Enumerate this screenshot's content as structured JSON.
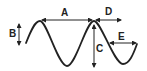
{
  "diagram": {
    "type": "wave-anatomy",
    "stroke_color": "#222222",
    "background": "#ffffff",
    "labels": {
      "A": "A",
      "B": "B",
      "C": "C",
      "D": "D",
      "E": "E"
    }
  }
}
